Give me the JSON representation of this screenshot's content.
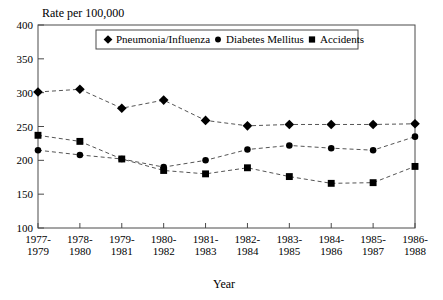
{
  "chart_data": {
    "type": "line",
    "title": "",
    "xlabel": "Year",
    "ylabel": "Rate per 100,000",
    "ylim": [
      100,
      400
    ],
    "yticks": [
      100,
      150,
      200,
      250,
      300,
      350,
      400
    ],
    "grid": false,
    "legend_position": "top-center",
    "categories": [
      "1977-\n1979",
      "1978-\n1980",
      "1979-\n1981",
      "1980-\n1982",
      "1981-\n1983",
      "1982-\n1984",
      "1983-\n1985",
      "1984-\n1986",
      "1985-\n1987",
      "1986-\n1988"
    ],
    "categories_line1": [
      "1977-",
      "1978-",
      "1979-",
      "1980-",
      "1981-",
      "1982-",
      "1983-",
      "1984-",
      "1985-",
      "1986-"
    ],
    "categories_line2": [
      "1979",
      "1980",
      "1981",
      "1982",
      "1983",
      "1984",
      "1985",
      "1986",
      "1987",
      "1988"
    ],
    "series": [
      {
        "name": "Pneumonia/Influenza",
        "marker": "diamond",
        "values": [
          301,
          305,
          277,
          289,
          259,
          251,
          253,
          253,
          253,
          254
        ]
      },
      {
        "name": "Diabetes Mellitus",
        "marker": "circle",
        "values": [
          215,
          208,
          202,
          190,
          200,
          216,
          222,
          218,
          215,
          235
        ]
      },
      {
        "name": "Accidents",
        "marker": "square",
        "values": [
          237,
          228,
          202,
          185,
          180,
          189,
          176,
          166,
          167,
          191
        ]
      }
    ]
  },
  "legend": {
    "items": [
      {
        "label": "Pneumonia/Influenza",
        "marker": "diamond"
      },
      {
        "label": "Diabetes Mellitus",
        "marker": "circle"
      },
      {
        "label": "Accidents",
        "marker": "square"
      }
    ]
  },
  "colors": {
    "marker": "#000000",
    "line": "#555555",
    "axis": "#4a4a4a",
    "background": "#ffffff",
    "text": "#000000"
  }
}
